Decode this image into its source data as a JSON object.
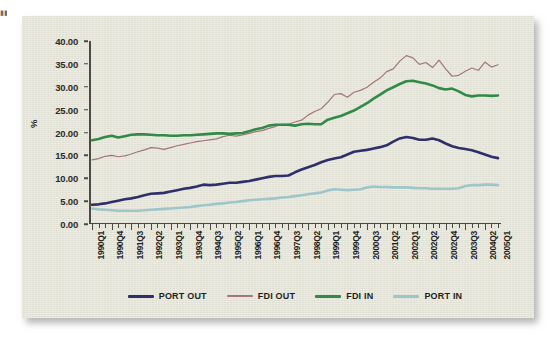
{
  "figure": {
    "background_color": "#e6e5d8",
    "margin_text_fragment": "▮▮▮"
  },
  "axes": {
    "y_title": "%",
    "y_ticks": [
      "0.00",
      "5.00",
      "10.00",
      "15.00",
      "20.00",
      "25.00",
      "30.00",
      "35.00",
      "40.00"
    ],
    "x_tick_labels": [
      "1990Q1",
      "1990Q4",
      "1991Q3",
      "1992Q2",
      "1993Q1",
      "1993Q4",
      "1994Q3",
      "1995Q2",
      "1996Q1",
      "1996Q4",
      "1997Q3",
      "1998Q2",
      "1999Q1",
      "1999Q4",
      "2000Q3",
      "2001Q2",
      "2002Q1",
      "2002Q2",
      "2002Q4",
      "2003Q3",
      "2004Q2",
      "2005Q1"
    ]
  },
  "legend": {
    "items": [
      {
        "label": "PORT OUT",
        "color": "#2e2f6b"
      },
      {
        "label": "FDI OUT",
        "color": "#a4757e"
      },
      {
        "label": "FDI IN",
        "color": "#2f8b45"
      },
      {
        "label": "PORT IN",
        "color": "#9dc6cb"
      }
    ]
  },
  "chart_data": {
    "type": "line",
    "title": "",
    "subtitle": "",
    "xlabel": "",
    "ylabel": "%",
    "ylim": [
      0,
      40
    ],
    "ytick_step": 5,
    "grid": false,
    "legend_position": "bottom",
    "x_axis_note": "quarterly ticks, labels every 3rd quarter",
    "x": [
      "1990Q1",
      "1990Q2",
      "1990Q3",
      "1990Q4",
      "1991Q1",
      "1991Q2",
      "1991Q3",
      "1991Q4",
      "1992Q1",
      "1992Q2",
      "1992Q3",
      "1992Q4",
      "1993Q1",
      "1993Q2",
      "1993Q3",
      "1993Q4",
      "1994Q1",
      "1994Q2",
      "1994Q3",
      "1994Q4",
      "1995Q1",
      "1995Q2",
      "1995Q3",
      "1995Q4",
      "1996Q1",
      "1996Q2",
      "1996Q3",
      "1996Q4",
      "1997Q1",
      "1997Q2",
      "1997Q3",
      "1997Q4",
      "1998Q1",
      "1998Q2",
      "1998Q3",
      "1998Q4",
      "1999Q1",
      "1999Q2",
      "1999Q3",
      "1999Q4",
      "2000Q1",
      "2000Q2",
      "2000Q3",
      "2000Q4",
      "2001Q1",
      "2001Q2",
      "2001Q3",
      "2001Q4",
      "2002Q1",
      "2002Q2",
      "2002Q3",
      "2002Q4",
      "2003Q1",
      "2003Q2",
      "2003Q3",
      "2003Q4",
      "2004Q1",
      "2004Q2",
      "2004Q3",
      "2004Q4",
      "2005Q1",
      "2005Q2",
      "2005Q3"
    ],
    "series": [
      {
        "name": "PORT OUT",
        "color": "#2e2f6b",
        "width": 2.6,
        "values": [
          4.2,
          4.3,
          4.5,
          4.8,
          5.1,
          5.4,
          5.6,
          5.9,
          6.3,
          6.6,
          6.7,
          6.8,
          7.1,
          7.4,
          7.7,
          7.9,
          8.2,
          8.6,
          8.5,
          8.6,
          8.8,
          9.0,
          9.0,
          9.2,
          9.4,
          9.7,
          10.0,
          10.3,
          10.5,
          10.5,
          10.6,
          11.3,
          11.9,
          12.4,
          12.9,
          13.5,
          14.0,
          14.3,
          14.6,
          15.2,
          15.8,
          16.0,
          16.2,
          16.5,
          16.8,
          17.2,
          18.0,
          18.7,
          19.0,
          18.8,
          18.4,
          18.4,
          18.7,
          18.3,
          17.6,
          17.0,
          16.6,
          16.4,
          16.1,
          15.7,
          15.2,
          14.7,
          14.4
        ]
      },
      {
        "name": "FDI OUT",
        "color": "#a4757e",
        "width": 1.2,
        "values": [
          14.0,
          14.3,
          14.8,
          15.0,
          14.7,
          14.9,
          15.3,
          15.8,
          16.2,
          16.7,
          16.6,
          16.3,
          16.7,
          17.1,
          17.4,
          17.7,
          18.0,
          18.2,
          18.4,
          18.6,
          19.1,
          19.4,
          19.2,
          19.5,
          19.8,
          20.2,
          20.4,
          20.9,
          21.3,
          21.8,
          21.8,
          22.3,
          22.7,
          23.8,
          24.6,
          25.2,
          26.6,
          28.3,
          28.5,
          27.7,
          28.8,
          29.2,
          29.9,
          31.0,
          31.9,
          33.3,
          33.9,
          35.6,
          36.8,
          36.3,
          34.9,
          35.3,
          34.2,
          35.8,
          33.9,
          32.3,
          32.5,
          33.4,
          34.1,
          33.6,
          35.4,
          34.3,
          34.8
        ]
      },
      {
        "name": "FDI IN",
        "color": "#2f8b45",
        "width": 2.6,
        "values": [
          18.3,
          18.6,
          19.0,
          19.3,
          18.9,
          19.2,
          19.5,
          19.6,
          19.6,
          19.5,
          19.4,
          19.4,
          19.3,
          19.3,
          19.4,
          19.4,
          19.5,
          19.6,
          19.7,
          19.8,
          19.8,
          19.7,
          19.8,
          19.9,
          20.3,
          20.7,
          21.0,
          21.5,
          21.7,
          21.7,
          21.7,
          21.5,
          21.8,
          21.9,
          21.8,
          21.8,
          22.8,
          23.2,
          23.6,
          24.2,
          24.8,
          25.6,
          26.4,
          27.4,
          28.3,
          29.2,
          29.9,
          30.6,
          31.2,
          31.3,
          31.0,
          30.7,
          30.3,
          29.7,
          29.4,
          29.6,
          29.0,
          28.2,
          27.9,
          28.1,
          28.1,
          28.0,
          28.1
        ]
      },
      {
        "name": "PORT IN",
        "color": "#9dc6cb",
        "width": 2.6,
        "values": [
          3.4,
          3.2,
          3.1,
          3.0,
          2.9,
          2.9,
          2.9,
          2.9,
          3.0,
          3.1,
          3.2,
          3.3,
          3.4,
          3.5,
          3.6,
          3.7,
          3.9,
          4.1,
          4.2,
          4.4,
          4.5,
          4.7,
          4.8,
          5.0,
          5.2,
          5.3,
          5.4,
          5.5,
          5.6,
          5.8,
          5.9,
          6.1,
          6.3,
          6.5,
          6.7,
          6.9,
          7.3,
          7.6,
          7.5,
          7.4,
          7.5,
          7.6,
          8.0,
          8.2,
          8.1,
          8.1,
          8.0,
          8.0,
          8.0,
          7.9,
          7.8,
          7.8,
          7.7,
          7.7,
          7.7,
          7.7,
          7.8,
          8.3,
          8.5,
          8.5,
          8.6,
          8.6,
          8.5
        ]
      }
    ]
  }
}
